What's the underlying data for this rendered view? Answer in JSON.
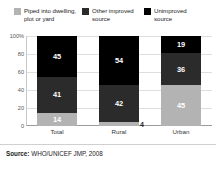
{
  "chart_data": {
    "type": "bar",
    "subtype": "stacked-100-percent",
    "title": "",
    "xlabel": "",
    "ylabel": "",
    "ylim": [
      0,
      100
    ],
    "yticks": [
      "100%",
      "80",
      "60",
      "40",
      "20",
      "0"
    ],
    "ytick_values": [
      100,
      80,
      60,
      40,
      20,
      0
    ],
    "grid": true,
    "legend_position": "top",
    "categories": [
      "Total",
      "Rural",
      "Urban"
    ],
    "series": [
      {
        "name": "Piped into dwelling, plot or yard",
        "color": "#b3b3b3",
        "label_color": "#ffffff",
        "values": [
          14,
          4,
          45
        ],
        "labels": [
          "14",
          "4",
          "45"
        ],
        "label_placement": [
          "inside",
          "outside",
          "inside"
        ]
      },
      {
        "name": "Other improved source",
        "color": "#2b2b2b",
        "label_color": "#ffffff",
        "values": [
          41,
          42,
          36
        ],
        "labels": [
          "41",
          "42",
          "36"
        ],
        "label_placement": [
          "inside",
          "inside",
          "inside"
        ]
      },
      {
        "name": "Unimproved source",
        "color": "#000000",
        "label_color": "#ffffff",
        "values": [
          45,
          54,
          19
        ],
        "labels": [
          "45",
          "54",
          "19"
        ],
        "label_placement": [
          "inside",
          "inside",
          "inside"
        ]
      }
    ]
  },
  "legend": {
    "entries": [
      {
        "label": "Piped into dwelling, plot or yard",
        "color": "#b3b3b3"
      },
      {
        "label": "Other improved source",
        "color": "#2b2b2b"
      },
      {
        "label": "Unimproved source",
        "color": "#000000"
      }
    ]
  },
  "source": {
    "prefix": "Source:",
    "text": "WHO/UNICEF JMP, 2008"
  }
}
